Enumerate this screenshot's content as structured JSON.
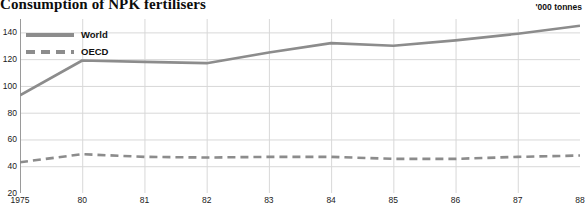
{
  "chart_data": {
    "type": "line",
    "title": "Consumption of NPK fertilisers",
    "unit_label": "'000 tonnes",
    "xlabel": "",
    "ylabel": "",
    "ylim": [
      20,
      150
    ],
    "yticks": [
      20,
      40,
      60,
      80,
      100,
      120,
      140
    ],
    "grid": true,
    "legend_position": "top-left",
    "x": [
      1975,
      1980,
      1981,
      1982,
      1983,
      1984,
      1985,
      1986,
      1987,
      1988
    ],
    "xtick_labels": [
      "1975",
      "80",
      "81",
      "82",
      "83",
      "84",
      "85",
      "86",
      "87",
      "88"
    ],
    "series": [
      {
        "name": "World",
        "style": "solid",
        "color": "#8c8c8c",
        "values": [
          93,
          119,
          118,
          117,
          125,
          132,
          130,
          134,
          139,
          145
        ]
      },
      {
        "name": "OECD",
        "style": "dashed",
        "color": "#8c8c8c",
        "values": [
          43,
          49,
          47,
          46.5,
          47,
          47,
          45.5,
          45.5,
          47,
          48
        ]
      }
    ]
  }
}
